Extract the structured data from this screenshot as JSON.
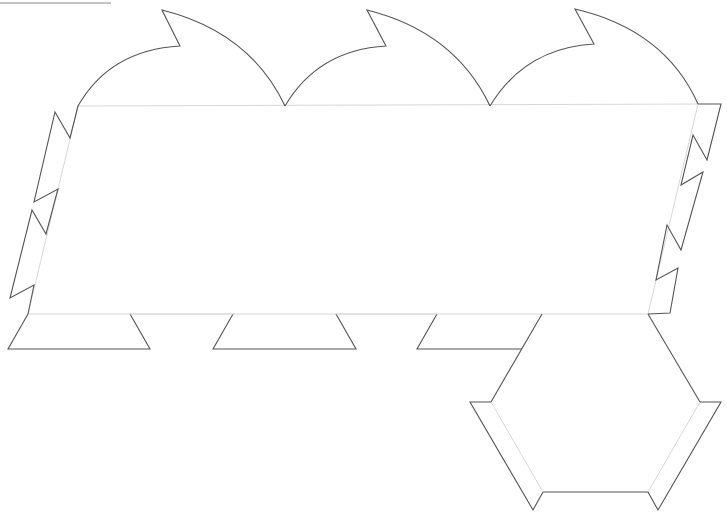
{
  "diagram": {
    "type": "papercraft-net",
    "colors": {
      "cut_line": "#555555",
      "fold_line": "#d8d8d8",
      "background": "#ffffff"
    },
    "parts": [
      {
        "name": "main-panel",
        "shape": "parallelogram",
        "corners": [
          [
            78,
            106
          ],
          [
            698,
            104
          ],
          [
            648,
            314
          ],
          [
            28,
            314
          ]
        ]
      },
      {
        "name": "top-scallop-tabs",
        "count": 3
      },
      {
        "name": "left-glue-tabs",
        "count": 2
      },
      {
        "name": "right-glue-tabs",
        "count": 2
      },
      {
        "name": "bottom-trapezoid-tabs",
        "count": 3
      },
      {
        "name": "hexagon-base",
        "shape": "hexagon"
      },
      {
        "name": "hexagon-glue-flaps",
        "count": 2
      }
    ]
  }
}
